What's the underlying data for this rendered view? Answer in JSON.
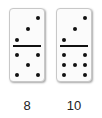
{
  "dominoes": [
    {
      "top": 3,
      "bottom": 5,
      "label": "8"
    },
    {
      "top": 3,
      "bottom": 7,
      "label": "10"
    }
  ]
}
